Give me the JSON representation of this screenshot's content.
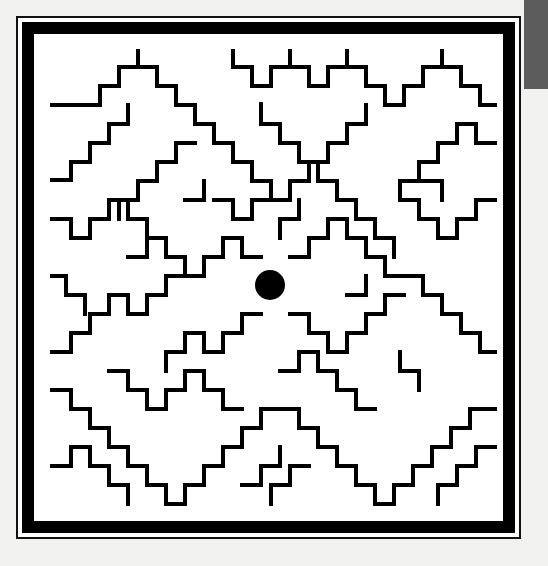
{
  "page": {
    "kind": "scanned-maze-figure",
    "background_color": "#efefee",
    "paper_color": "#f2f2f1",
    "width": 548,
    "height": 566
  },
  "artifact": {
    "name": "scanner-edge-block",
    "color": "#5c5c5c",
    "x": 524,
    "y": 0,
    "width": 24,
    "height": 89
  },
  "figure": {
    "title": "Maze",
    "ink_color": "#000000",
    "field_color": "#ffffff",
    "outer_rule": {
      "x": 17,
      "y": 17,
      "width": 503,
      "height": 521,
      "stroke": "#111111",
      "stroke_width": 2
    },
    "thick_frame": {
      "x": 28,
      "y": 28,
      "width": 481,
      "height": 499,
      "stroke": "#000000",
      "stroke_width": 12
    },
    "interior": {
      "x": 52,
      "y": 51,
      "width": 443,
      "height": 453
    },
    "wall_stroke_width": 4,
    "grid_cell_size": 19,
    "marker": {
      "name": "center-dot",
      "shape": "circle",
      "cx": 270,
      "cy": 285,
      "r": 15,
      "fill": "#000000"
    },
    "wall_paths": [
      "M52,105 L100,105 L100,86 L119,86 L119,67 L138,67 L138,51",
      "M138,51 L138,67 L157,67 L157,86 L176,86 L176,105 L195,105 L195,124 L214,124 L214,143 L233,143 L233,162",
      "M52,180 L71,180 L71,162 L90,162 L90,143 L109,143 L109,124 L128,124 L128,105",
      "M233,51 L233,67 L252,67 L252,86 L271,86 L271,67 L290,67 L290,51",
      "M290,51 L290,67 L309,67 L309,86 L328,86 L328,67 L347,67 L347,51",
      "M347,51 L347,67 L366,67 L366,86 L385,86 L385,105 L404,105 L404,86 L423,86 L423,67 L442,67 L442,51",
      "M442,51 L442,67 L461,67 L461,86 L480,86 L480,105 L495,105",
      "M495,143 L476,143 L476,124 L457,124 L457,143 L438,143 L438,162 L419,162 L419,181 L400,181 L400,200",
      "M400,200 L419,200 L419,219 L438,219 L438,238 L457,238 L457,219 L476,219 L476,200 L495,200",
      "M233,162 L252,162 L252,181 L271,181 L271,200 L290,200 L290,181 L309,181 L309,162 L328,162 L328,143 L347,143 L347,124 L366,124 L366,105",
      "M52,219 L71,219 L71,238 L90,238 L90,219 L109,219 L109,200 L128,200 L128,219 L147,219 L147,238 L166,238 L166,257 L185,257 L185,276",
      "M185,276 L166,276 L166,295 L147,295 L147,314 L128,314 L128,295 L109,295 L109,314 L90,314 L90,333 L71,333 L71,352 L52,352",
      "M185,276 L204,276 L204,257 L223,257 L223,238 L242,238 L242,257 L261,257",
      "M290,257 L309,257 L309,238 L328,238 L328,219 L347,219 L347,238 L366,238 L366,257 L385,257 L385,276 L404,276",
      "M290,314 L309,314 L309,333 L328,333 L328,352 L347,352 L347,333 L366,333 L366,314 L385,314 L385,295 L404,295",
      "M261,314 L242,314 L242,333 L223,333 L223,352 L204,352 L204,333 L185,333 L185,352 L166,352 L166,371",
      "M404,276 L423,276 L423,295 L442,295 L442,314 L461,314 L461,333 L480,333 L480,352 L495,352",
      "M52,390 L71,390 L71,409 L90,409 L90,428 L109,428 L109,447 L128,447 L128,466 L147,466 L147,485 L166,485 L166,504",
      "M166,504 L185,504 L185,485 L204,485 L204,466 L223,466 L223,447 L242,447 L242,428 L261,428 L261,409 L280,409",
      "M280,409 L299,409 L299,428 L318,428 L318,447 L337,447 L337,466 L356,466 L356,485 L375,485 L375,504",
      "M375,504 L394,504 L394,485 L413,485 L413,466 L432,466 L432,447 L451,447 L451,428 L470,428 L470,409 L489,409 L495,409",
      "M495,447 L476,447 L476,466 L457,466 L457,485 L438,485 L438,504",
      "M280,371 L299,371 L299,352 L318,352 L318,371 L337,371 L337,390 L356,390 L356,409 L375,409",
      "M109,371 L128,371 L128,390 L147,390 L147,409 L166,409 L166,390 L185,390 L185,371 L204,371 L204,390 L223,390 L223,409 L242,409",
      "M52,466 L71,466 L71,447 L90,447 L90,466 L109,466 L109,485 L128,485 L128,504",
      "M261,104 L261,124 L280,124 L280,143 L299,143 L299,162 L318,162 L318,181 L337,181 L337,200 L356,200",
      "M356,200 L356,219 L375,219 L375,238 L394,238 L394,257",
      "M195,143 L176,143 L176,162 L157,162 L157,181 L138,181 L138,200 L119,200 L119,219",
      "M214,200 L233,200 L233,219 L252,219 L252,200 L271,200",
      "M128,257 L147,257 L147,238",
      "M242,485 L261,485 L261,466 L280,466 L280,447",
      "M309,466 L290,466 L290,485 L271,485 L271,504",
      "M423,181 L442,181 L442,200",
      "M85,314 L85,295 L66,295 L66,276 L52,276",
      "M400,352 L400,371 L419,371 L419,390",
      "M185,200 L204,200 L204,181",
      "M299,200 L299,219 L280,219 L280,238",
      "M347,295 L366,295 L366,276"
    ]
  }
}
